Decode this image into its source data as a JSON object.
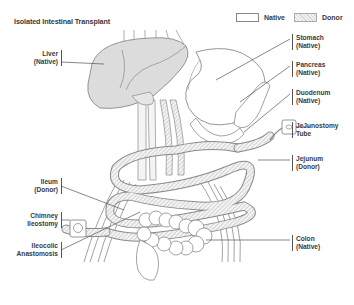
{
  "title": "Isolated Intestinal Transplant",
  "legend": {
    "items": [
      {
        "label": "Native",
        "style": "plain"
      },
      {
        "label": "Donor",
        "style": "hatched"
      }
    ]
  },
  "labels": {
    "liver": {
      "name": "Liver",
      "status": "(Native)"
    },
    "stomach": {
      "name": "Stomach",
      "status": "(Native)"
    },
    "pancreas": {
      "name": "Pancreas",
      "status": "(Native)"
    },
    "duodenum": {
      "name": "Duodenum",
      "status": "(Native)"
    },
    "jejunostomy": {
      "name": "JeJunostomy",
      "status": "Tube"
    },
    "jejunum": {
      "name": "Jejunum",
      "status": "(Donor)"
    },
    "ileum": {
      "name": "Ileum",
      "status": "(Donor)"
    },
    "chimney": {
      "name": "Chimney",
      "status": "Ileostomy"
    },
    "ileocolic": {
      "name": "Ileocolic",
      "status": "Anastomosis"
    },
    "colon": {
      "name": "Colon",
      "status": "(Native)"
    }
  },
  "colors": {
    "native_fill": "#ffffff",
    "organ_shade": "#dddddd",
    "donor_hatch": "#c8c8c8",
    "outline": "#888888",
    "text": "#3a3a3a"
  }
}
